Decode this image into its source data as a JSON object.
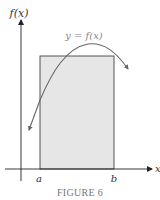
{
  "figure": {
    "caption": "FIGURE 6",
    "y_axis_label": "f(x)",
    "x_axis_label": "x",
    "curve_label": "y = f(x)",
    "a_label": "a",
    "b_label": "b"
  },
  "colors": {
    "axis": "#222222",
    "curve": "#666666",
    "rect_fill": "#e6e6e6",
    "rect_stroke": "#444444",
    "caption": "#777777"
  }
}
